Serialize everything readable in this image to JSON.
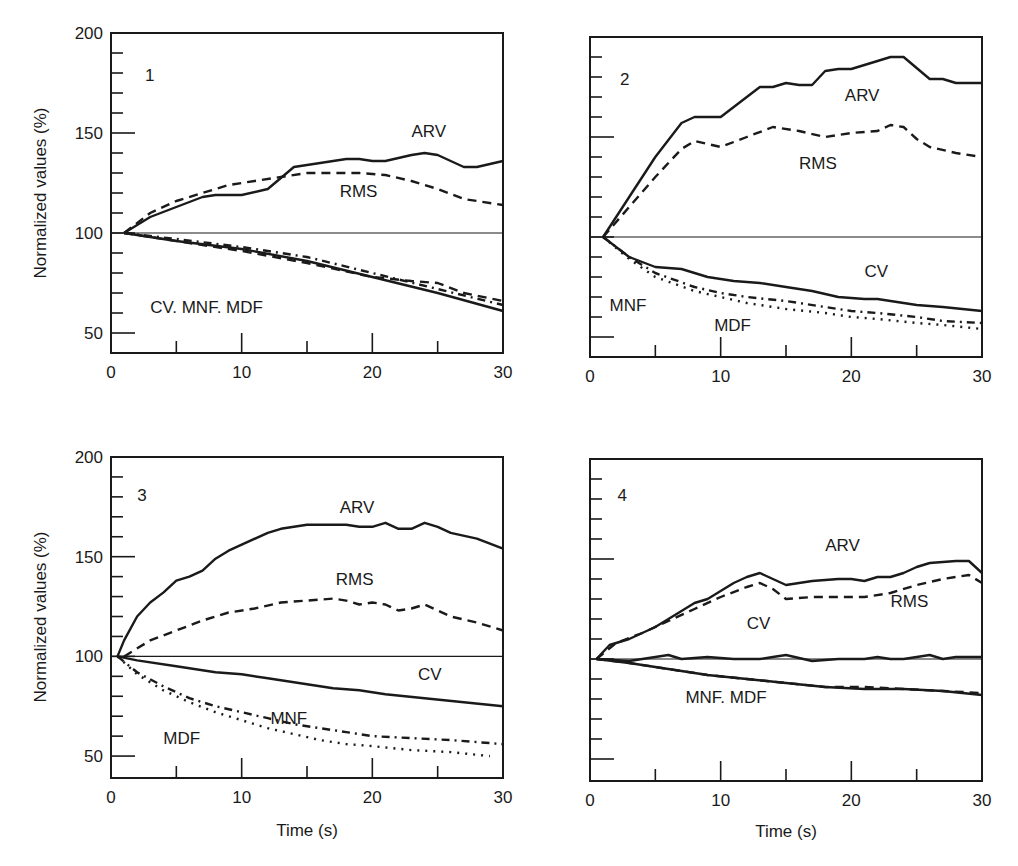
{
  "figure": {
    "ylabel": "Normalized values (%)",
    "xlabel": "Time (s)",
    "colors": {
      "ink": "#1a1a1a",
      "background": "#ffffff"
    }
  },
  "chart_data": [
    {
      "type": "line",
      "panel": "1",
      "xlabel": "",
      "ylabel": "Normalized values (%)",
      "xlim": [
        0,
        30
      ],
      "ylim": [
        40,
        200
      ],
      "xticks": [
        0,
        10,
        20,
        30
      ],
      "yticks": [
        50,
        100,
        150,
        200
      ],
      "show_xtick_labels": true,
      "show_ytick_labels": true,
      "frame": {
        "x": 111,
        "y": 33,
        "w": 392,
        "h": 320
      },
      "annotations": [
        {
          "text": "1",
          "x": 2.6,
          "y": 176
        },
        {
          "text": "ARV",
          "x": 23,
          "y": 148
        },
        {
          "text": "RMS",
          "x": 17.5,
          "y": 118
        },
        {
          "text": "CV. MNF. MDF",
          "x": 3,
          "y": 60
        }
      ],
      "series": [
        {
          "name": "ARV",
          "style": "solid",
          "x": [
            1,
            3,
            5,
            7,
            8,
            10,
            12,
            14,
            16,
            18,
            19,
            20,
            21,
            23,
            24,
            25,
            26,
            27,
            28,
            30
          ],
          "y": [
            100,
            108,
            113,
            118,
            119,
            119,
            122,
            133,
            135,
            137,
            137,
            136,
            136,
            139,
            140,
            139,
            136,
            133,
            133,
            136
          ]
        },
        {
          "name": "RMS",
          "style": "dashed",
          "x": [
            1,
            3,
            5,
            7,
            9,
            11,
            13,
            15,
            17,
            19,
            21,
            23,
            25,
            27,
            30
          ],
          "y": [
            100,
            110,
            116,
            120,
            124,
            126,
            128,
            130,
            130,
            130,
            129,
            126,
            122,
            117,
            114
          ]
        },
        {
          "name": "CV",
          "style": "solid",
          "x": [
            1,
            5,
            10,
            15,
            20,
            25,
            30
          ],
          "y": [
            100,
            96,
            92,
            86,
            78,
            70,
            61
          ]
        },
        {
          "name": "MNF",
          "style": "dashed",
          "x": [
            1,
            3,
            6,
            10,
            15,
            20,
            23,
            25,
            27,
            30
          ],
          "y": [
            100,
            98,
            95,
            91,
            85,
            78,
            76,
            75,
            70,
            66
          ]
        },
        {
          "name": "MDF",
          "style": "dashdot",
          "x": [
            1,
            5,
            10,
            15,
            20,
            25,
            30
          ],
          "y": [
            100,
            97,
            93,
            88,
            80,
            72,
            64
          ]
        }
      ]
    },
    {
      "type": "line",
      "panel": "2",
      "xlabel": "",
      "ylabel": "",
      "xlim": [
        0,
        30
      ],
      "ylim": [
        40,
        200
      ],
      "xticks": [
        0,
        10,
        20,
        30
      ],
      "yticks": [
        50,
        100,
        150,
        200
      ],
      "show_xtick_labels": true,
      "show_ytick_labels": false,
      "frame": {
        "x": 590,
        "y": 37,
        "w": 392,
        "h": 320
      },
      "annotations": [
        {
          "text": "2",
          "x": 2.3,
          "y": 176
        },
        {
          "text": "ARV",
          "x": 19.5,
          "y": 168
        },
        {
          "text": "RMS",
          "x": 16,
          "y": 134
        },
        {
          "text": "CV",
          "x": 21,
          "y": 80
        },
        {
          "text": "MNF",
          "x": 1.5,
          "y": 63
        },
        {
          "text": "MDF",
          "x": 9.5,
          "y": 53
        }
      ],
      "series": [
        {
          "name": "ARV",
          "style": "solid",
          "x": [
            1,
            3,
            5,
            7,
            8,
            10,
            12,
            13,
            14,
            15,
            16,
            17,
            18,
            19,
            20,
            22,
            23,
            24,
            26,
            27,
            28,
            30
          ],
          "y": [
            100,
            120,
            140,
            157,
            160,
            160,
            170,
            175,
            175,
            177,
            176,
            176,
            183,
            184,
            184,
            188,
            190,
            190,
            179,
            179,
            177,
            177
          ]
        },
        {
          "name": "RMS",
          "style": "dashed",
          "x": [
            1,
            3,
            5,
            7,
            8,
            10,
            12,
            14,
            16,
            18,
            20,
            22,
            23,
            24,
            25,
            26,
            28,
            30
          ],
          "y": [
            100,
            115,
            130,
            144,
            148,
            145,
            150,
            155,
            153,
            150,
            152,
            153,
            156,
            155,
            149,
            145,
            142,
            140
          ]
        },
        {
          "name": "CV",
          "style": "solid",
          "x": [
            1,
            3,
            5,
            7,
            9,
            11,
            13,
            15,
            17,
            19,
            21,
            22,
            23,
            25,
            27,
            30
          ],
          "y": [
            100,
            90,
            85,
            84,
            80,
            78,
            77,
            75,
            73,
            70,
            69,
            69,
            68,
            66,
            65,
            63
          ]
        },
        {
          "name": "MNF",
          "style": "dashdot",
          "x": [
            1,
            3,
            5,
            8,
            10,
            12,
            15,
            18,
            20,
            22,
            25,
            27,
            30
          ],
          "y": [
            100,
            90,
            82,
            75,
            72,
            70,
            68,
            65,
            63,
            62,
            60,
            58,
            57
          ]
        },
        {
          "name": "MDF",
          "style": "dotted",
          "x": [
            1,
            3,
            5,
            8,
            10,
            12,
            15,
            18,
            20,
            22,
            25,
            27,
            30
          ],
          "y": [
            100,
            89,
            80,
            73,
            70,
            67,
            64,
            62,
            60,
            59,
            57,
            56,
            54
          ]
        }
      ]
    },
    {
      "type": "line",
      "panel": "3",
      "xlabel": "Time (s)",
      "ylabel": "Normalized values (%)",
      "xlim": [
        0,
        30
      ],
      "ylim": [
        39,
        200
      ],
      "xticks": [
        0,
        10,
        20,
        30
      ],
      "yticks": [
        50,
        100,
        150,
        200
      ],
      "show_xtick_labels": true,
      "show_ytick_labels": true,
      "frame": {
        "x": 111,
        "y": 457,
        "w": 392,
        "h": 321
      },
      "annotations": [
        {
          "text": "3",
          "x": 2.0,
          "y": 178
        },
        {
          "text": "ARV",
          "x": 17.5,
          "y": 172
        },
        {
          "text": "RMS",
          "x": 17.2,
          "y": 136
        },
        {
          "text": "CV",
          "x": 23.5,
          "y": 88
        },
        {
          "text": "MNF",
          "x": 12.2,
          "y": 66
        },
        {
          "text": "MDF",
          "x": 4,
          "y": 56
        }
      ],
      "series": [
        {
          "name": "ARV",
          "style": "solid",
          "x": [
            0.5,
            1,
            2,
            3,
            4,
            5,
            6,
            7,
            8,
            9,
            10,
            12,
            13,
            15,
            16,
            18,
            19,
            20,
            21,
            22,
            23,
            24,
            25,
            26,
            28,
            30
          ],
          "y": [
            100,
            108,
            120,
            127,
            132,
            138,
            140,
            143,
            149,
            153,
            156,
            162,
            164,
            166,
            166,
            166,
            165,
            165,
            167,
            164,
            164,
            167,
            165,
            162,
            159,
            154
          ]
        },
        {
          "name": "RMS",
          "style": "dashed",
          "x": [
            1,
            3,
            5,
            7,
            9,
            11,
            13,
            15,
            17,
            18,
            19,
            20,
            21,
            22,
            23,
            24,
            25,
            26,
            28,
            30
          ],
          "y": [
            100,
            108,
            113,
            118,
            122,
            124,
            127,
            128,
            129,
            128,
            126,
            127,
            126,
            123,
            124,
            126,
            123,
            120,
            117,
            113
          ]
        },
        {
          "name": "CV",
          "style": "solid",
          "x": [
            0.5,
            2,
            5,
            8,
            10,
            12,
            15,
            17,
            19,
            20,
            21,
            24,
            27,
            30
          ],
          "y": [
            100,
            98,
            95,
            92,
            91,
            89,
            86,
            84,
            83,
            82,
            81,
            79,
            77,
            75
          ]
        },
        {
          "name": "MNF",
          "style": "dashdot",
          "x": [
            0.5,
            2,
            4,
            6,
            8,
            10,
            12,
            14,
            16,
            18,
            20,
            23,
            26,
            30
          ],
          "y": [
            100,
            92,
            85,
            79,
            75,
            72,
            69,
            66,
            64,
            62,
            60,
            59,
            58,
            56
          ]
        },
        {
          "name": "MDF",
          "style": "dotted",
          "x": [
            0.5,
            2,
            4,
            6,
            8,
            10,
            12,
            14,
            16,
            18,
            20,
            23,
            26,
            29
          ],
          "y": [
            100,
            91,
            83,
            77,
            72,
            68,
            64,
            61,
            58,
            56,
            55,
            53,
            52,
            50
          ]
        }
      ]
    },
    {
      "type": "line",
      "panel": "4",
      "xlabel": "Time (s)",
      "ylabel": "",
      "xlim": [
        0,
        30
      ],
      "ylim": [
        39,
        200
      ],
      "xticks": [
        0,
        10,
        20,
        30
      ],
      "yticks": [
        50,
        100,
        150,
        200
      ],
      "show_xtick_labels": true,
      "show_ytick_labels": false,
      "frame": {
        "x": 590,
        "y": 459,
        "w": 392,
        "h": 322
      },
      "annotations": [
        {
          "text": "4",
          "x": 2.1,
          "y": 179
        },
        {
          "text": "ARV",
          "x": 18,
          "y": 154
        },
        {
          "text": "RMS",
          "x": 23,
          "y": 126
        },
        {
          "text": "CV",
          "x": 12,
          "y": 115
        },
        {
          "text": "MNF. MDF",
          "x": 7.3,
          "y": 78
        }
      ],
      "series": [
        {
          "name": "ARV",
          "style": "solid",
          "x": [
            0.5,
            1.5,
            3,
            5,
            7,
            8,
            9,
            11,
            12,
            13,
            14,
            15,
            17,
            19,
            20,
            21,
            22,
            23,
            24,
            25,
            26,
            28,
            29,
            30
          ],
          "y": [
            100,
            107,
            110,
            116,
            124,
            128,
            130,
            138,
            141,
            143,
            140,
            137,
            139,
            140,
            140,
            139,
            141,
            141,
            143,
            146,
            148,
            149,
            149,
            143
          ]
        },
        {
          "name": "RMS",
          "style": "dashed",
          "x": [
            0.5,
            2,
            4,
            6,
            8,
            10,
            12,
            13,
            14,
            15,
            17,
            19,
            21,
            23,
            25,
            27,
            29,
            30
          ],
          "y": [
            100,
            108,
            113,
            119,
            125,
            131,
            136,
            138,
            135,
            130,
            131,
            131,
            131,
            133,
            137,
            140,
            142,
            138
          ]
        },
        {
          "name": "CV",
          "style": "solid",
          "x": [
            0.5,
            3,
            5,
            6,
            7,
            9,
            11,
            13,
            14,
            15,
            17,
            19,
            21,
            22,
            23,
            24,
            25,
            26,
            27,
            28,
            30
          ],
          "y": [
            100,
            99,
            101,
            102,
            100,
            101,
            100,
            100,
            101,
            102,
            99,
            100,
            100,
            101,
            100,
            100,
            101,
            102,
            100,
            101,
            101
          ]
        },
        {
          "name": "MNF",
          "style": "solid",
          "x": [
            0.5,
            3,
            6,
            9,
            12,
            15,
            18,
            21,
            24,
            27,
            30
          ],
          "y": [
            100,
            98,
            95,
            92,
            90,
            88,
            86,
            85,
            85,
            84,
            82
          ]
        },
        {
          "name": "MDF",
          "style": "dashed",
          "x": [
            0.5,
            3,
            6,
            9,
            12,
            15,
            18,
            21,
            24,
            27,
            30
          ],
          "y": [
            100,
            98,
            95,
            92,
            90,
            88,
            86,
            86,
            85,
            84,
            83
          ]
        }
      ]
    }
  ]
}
